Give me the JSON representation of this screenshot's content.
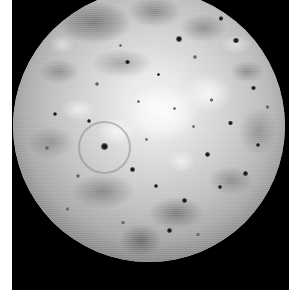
{
  "document": {
    "kind": "astronomical-photograph",
    "subject": "Io",
    "color_mode": "grayscale",
    "caption": "",
    "background_color": "#ffffff",
    "frame_color": "#000000"
  },
  "frame": {
    "x": 12,
    "y": 0,
    "width": 277,
    "height": 290
  },
  "disk": {
    "label": "planetary-disk",
    "center_x": 149,
    "center_y": 126,
    "radius": 136,
    "highlight_color": "#f2f2f2",
    "midtone_color": "#c4c4c4",
    "shadow_color": "#3d3d3d"
  },
  "surface_features": {
    "bright_plains_label": "bright sulfur dioxide plains",
    "dark_patera_label": "dark volcanic patera",
    "grey_terrain_label": "mottled grey terrain",
    "dark_spots": [
      {
        "x": 61.0,
        "y": 18.0,
        "r": 3.0,
        "soft": false
      },
      {
        "x": 76.5,
        "y": 10.5,
        "r": 2.2,
        "soft": false
      },
      {
        "x": 42.0,
        "y": 26.5,
        "r": 2.4,
        "soft": false
      },
      {
        "x": 53.5,
        "y": 31.0,
        "r": 1.8,
        "soft": false
      },
      {
        "x": 31.0,
        "y": 34.5,
        "r": 2.0,
        "soft": true
      },
      {
        "x": 39.5,
        "y": 20.5,
        "r": 1.6,
        "soft": true
      },
      {
        "x": 67.0,
        "y": 24.5,
        "r": 2.0,
        "soft": true
      },
      {
        "x": 82.0,
        "y": 18.5,
        "r": 2.6,
        "soft": false
      },
      {
        "x": 88.5,
        "y": 36.0,
        "r": 2.3,
        "soft": false
      },
      {
        "x": 73.0,
        "y": 40.5,
        "r": 1.7,
        "soft": true
      },
      {
        "x": 59.5,
        "y": 43.5,
        "r": 1.6,
        "soft": true
      },
      {
        "x": 46.0,
        "y": 41.0,
        "r": 1.5,
        "soft": true
      },
      {
        "x": 28.0,
        "y": 48.0,
        "r": 2.0,
        "soft": false
      },
      {
        "x": 15.5,
        "y": 45.5,
        "r": 2.2,
        "soft": false
      },
      {
        "x": 12.5,
        "y": 58.0,
        "r": 1.8,
        "soft": true
      },
      {
        "x": 33.5,
        "y": 57.5,
        "r": 3.4,
        "soft": false
      },
      {
        "x": 24.0,
        "y": 68.5,
        "r": 2.1,
        "soft": true
      },
      {
        "x": 44.0,
        "y": 66.0,
        "r": 2.7,
        "soft": false
      },
      {
        "x": 52.5,
        "y": 72.0,
        "r": 2.0,
        "soft": false
      },
      {
        "x": 63.0,
        "y": 77.5,
        "r": 2.6,
        "soft": false
      },
      {
        "x": 71.5,
        "y": 60.5,
        "r": 2.4,
        "soft": false
      },
      {
        "x": 80.0,
        "y": 49.0,
        "r": 2.2,
        "soft": false
      },
      {
        "x": 90.0,
        "y": 57.0,
        "r": 2.0,
        "soft": false
      },
      {
        "x": 85.5,
        "y": 67.5,
        "r": 2.5,
        "soft": false
      },
      {
        "x": 76.0,
        "y": 72.5,
        "r": 2.1,
        "soft": false
      },
      {
        "x": 57.5,
        "y": 88.5,
        "r": 2.3,
        "soft": false
      },
      {
        "x": 40.5,
        "y": 85.5,
        "r": 1.8,
        "soft": true
      },
      {
        "x": 68.0,
        "y": 90.0,
        "r": 1.7,
        "soft": true
      },
      {
        "x": 93.5,
        "y": 43.0,
        "r": 1.6,
        "soft": true
      },
      {
        "x": 20.0,
        "y": 80.5,
        "r": 1.9,
        "soft": true
      },
      {
        "x": 49.0,
        "y": 55.0,
        "r": 1.4,
        "soft": true
      },
      {
        "x": 66.5,
        "y": 50.0,
        "r": 1.5,
        "soft": true
      }
    ],
    "rings": [
      {
        "x": 33.0,
        "y": 57.0,
        "r": 9.0
      }
    ]
  }
}
